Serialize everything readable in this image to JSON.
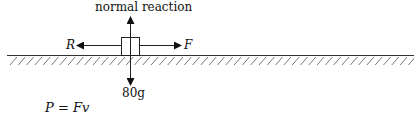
{
  "diagram": {
    "labels": {
      "normal": "normal reaction",
      "left_force": "R",
      "right_force": "F",
      "weight": "80g"
    },
    "equation": "P = Fv",
    "colors": {
      "ink": "#111111",
      "background": "#ffffff"
    }
  }
}
